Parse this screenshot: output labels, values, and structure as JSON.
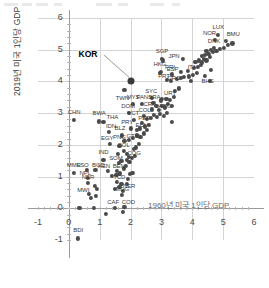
{
  "chart_data": {
    "type": "scatter",
    "title": "",
    "xlabel": "1960년 미국 1인당 GDP",
    "ylabel": "2019년 미국 1인당 GDP",
    "xlim": [
      -1,
      6
    ],
    "ylim": [
      -1,
      6
    ],
    "xticks": [
      "-1",
      "0",
      "1",
      "2",
      "3",
      "4",
      "5",
      "6"
    ],
    "yticks": [
      "-1",
      "0",
      "1",
      "2",
      "3",
      "4",
      "5",
      "6"
    ],
    "grid": true,
    "legend": "none",
    "highlight": {
      "label": "KOR",
      "x": 2.02,
      "y": 4.0,
      "callout_x": 0.62,
      "callout_y": 4.86
    },
    "points": [
      {
        "label": "BDI",
        "x": 0.3,
        "y": -0.95
      },
      {
        "label": "MWI",
        "x": 0.66,
        "y": 0.46
      },
      {
        "label": "NER",
        "x": 0.62,
        "y": 0.8
      },
      {
        "label": "NPL",
        "x": 0.63,
        "y": 0.97
      },
      {
        "label": "LSO",
        "x": 0.58,
        "y": 1.22
      },
      {
        "label": "MMR",
        "x": 0.16,
        "y": 1.12
      },
      {
        "label": "BGD",
        "x": 0.86,
        "y": 1.2
      },
      {
        "label": "IND",
        "x": 1.12,
        "y": 1.52
      },
      {
        "label": "KEN",
        "x": 1.27,
        "y": 1.18
      },
      {
        "label": "BEN",
        "x": 1.55,
        "y": 1.18
      },
      {
        "label": "TCD",
        "x": 1.57,
        "y": 0.84
      },
      {
        "label": "MDG",
        "x": 1.73,
        "y": 0.42
      },
      {
        "label": "NER2",
        "x": 1.76,
        "y": 0.56
      },
      {
        "label": "CAF",
        "x": 1.5,
        "y": 0.02
      },
      {
        "label": "COD",
        "x": 1.8,
        "y": 0.05
      },
      {
        "label": "SOM",
        "x": 1.62,
        "y": 1.42
      },
      {
        "label": "BOL",
        "x": 1.78,
        "y": 1.8
      },
      {
        "label": "COG",
        "x": 1.95,
        "y": 1.62
      },
      {
        "label": "EGY",
        "x": 1.34,
        "y": 2.02
      },
      {
        "label": "IDN",
        "x": 1.3,
        "y": 2.42
      },
      {
        "label": "THA",
        "x": 1.12,
        "y": 2.72
      },
      {
        "label": "BWA",
        "x": 0.98,
        "y": 2.74
      },
      {
        "label": "CHN",
        "x": 0.17,
        "y": 2.78
      },
      {
        "label": "BLZ",
        "x": 1.72,
        "y": 2.3
      },
      {
        "label": "GTM",
        "x": 1.95,
        "y": 2.16
      },
      {
        "label": "PNG",
        "x": 1.8,
        "y": 2.12
      },
      {
        "label": "PRY",
        "x": 2.02,
        "y": 2.52
      },
      {
        "label": "ECU",
        "x": 2.2,
        "y": 2.46
      },
      {
        "label": "VCT",
        "x": 2.12,
        "y": 2.78
      },
      {
        "label": "DOM",
        "x": 1.95,
        "y": 3.02
      },
      {
        "label": "COL",
        "x": 2.42,
        "y": 2.92
      },
      {
        "label": "PER",
        "x": 2.38,
        "y": 2.7
      },
      {
        "label": "MYS",
        "x": 2.08,
        "y": 3.28
      },
      {
        "label": "PAN",
        "x": 2.38,
        "y": 3.3
      },
      {
        "label": "CRI",
        "x": 2.68,
        "y": 3.12
      },
      {
        "label": "ARG",
        "x": 2.92,
        "y": 3.1
      },
      {
        "label": "BRA",
        "x": 2.74,
        "y": 3.32
      },
      {
        "label": "SYC",
        "x": 2.7,
        "y": 3.48
      },
      {
        "label": "URY",
        "x": 3.02,
        "y": 3.46
      },
      {
        "label": "TWN",
        "x": 1.8,
        "y": 3.72
      },
      {
        "label": "SGP",
        "x": 3.02,
        "y": 4.72
      },
      {
        "label": "HKG",
        "x": 2.98,
        "y": 4.3
      },
      {
        "label": "PRI",
        "x": 3.34,
        "y": 4.22
      },
      {
        "label": "PRT",
        "x": 3.18,
        "y": 4.06
      },
      {
        "label": "GRC",
        "x": 3.3,
        "y": 4.02
      },
      {
        "label": "ESP",
        "x": 3.62,
        "y": 4.3
      },
      {
        "label": "ITA",
        "x": 3.86,
        "y": 4.32
      },
      {
        "label": "JPN",
        "x": 3.7,
        "y": 4.72
      },
      {
        "label": "BHS",
        "x": 4.4,
        "y": 4.18
      },
      {
        "label": "DNK",
        "x": 4.7,
        "y": 5.06
      },
      {
        "label": "LUX",
        "x": 4.84,
        "y": 5.46
      },
      {
        "label": "NOR",
        "x": 4.72,
        "y": 5.3
      },
      {
        "label": "BMU",
        "x": 5.1,
        "y": 5.28
      }
    ],
    "extra_points": [
      {
        "x": 0.34,
        "y": 0.02
      },
      {
        "x": 0.8,
        "y": 0.02
      },
      {
        "x": 1.2,
        "y": -0.18
      },
      {
        "x": 1.74,
        "y": -0.12
      },
      {
        "x": 0.72,
        "y": 0.34
      },
      {
        "x": 0.88,
        "y": 0.4
      },
      {
        "x": 0.9,
        "y": 0.62
      },
      {
        "x": 0.84,
        "y": 0.7
      },
      {
        "x": 1.48,
        "y": 0.6
      },
      {
        "x": 1.64,
        "y": 0.68
      },
      {
        "x": 1.7,
        "y": 0.76
      },
      {
        "x": 1.88,
        "y": 0.78
      },
      {
        "x": 1.92,
        "y": 0.92
      },
      {
        "x": 1.98,
        "y": 1.08
      },
      {
        "x": 2.06,
        "y": 1.12
      },
      {
        "x": 1.4,
        "y": 1.02
      },
      {
        "x": 1.54,
        "y": 1.06
      },
      {
        "x": 1.66,
        "y": 1.1
      },
      {
        "x": 1.78,
        "y": 1.26
      },
      {
        "x": 1.86,
        "y": 1.34
      },
      {
        "x": 1.7,
        "y": 1.5
      },
      {
        "x": 1.88,
        "y": 1.52
      },
      {
        "x": 1.96,
        "y": 1.46
      },
      {
        "x": 2.04,
        "y": 1.58
      },
      {
        "x": 2.14,
        "y": 1.66
      },
      {
        "x": 1.6,
        "y": 1.72
      },
      {
        "x": 1.88,
        "y": 1.72
      },
      {
        "x": 2.1,
        "y": 1.86
      },
      {
        "x": 2.18,
        "y": 1.92
      },
      {
        "x": 1.64,
        "y": 1.96
      },
      {
        "x": 2.26,
        "y": 2.02
      },
      {
        "x": 2.08,
        "y": 2.22
      },
      {
        "x": 2.2,
        "y": 2.3
      },
      {
        "x": 2.32,
        "y": 2.26
      },
      {
        "x": 2.44,
        "y": 2.36
      },
      {
        "x": 2.3,
        "y": 2.52
      },
      {
        "x": 2.46,
        "y": 2.58
      },
      {
        "x": 2.54,
        "y": 2.48
      },
      {
        "x": 2.6,
        "y": 2.64
      },
      {
        "x": 2.52,
        "y": 2.82
      },
      {
        "x": 2.66,
        "y": 2.86
      },
      {
        "x": 2.76,
        "y": 2.94
      },
      {
        "x": 2.86,
        "y": 2.88
      },
      {
        "x": 2.96,
        "y": 2.98
      },
      {
        "x": 3.08,
        "y": 2.92
      },
      {
        "x": 3.18,
        "y": 3.02
      },
      {
        "x": 2.84,
        "y": 3.22
      },
      {
        "x": 3.02,
        "y": 3.24
      },
      {
        "x": 3.12,
        "y": 3.18
      },
      {
        "x": 3.22,
        "y": 3.3
      },
      {
        "x": 3.34,
        "y": 3.22
      },
      {
        "x": 2.98,
        "y": 3.4
      },
      {
        "x": 3.16,
        "y": 3.46
      },
      {
        "x": 3.28,
        "y": 3.42
      },
      {
        "x": 3.4,
        "y": 3.52
      },
      {
        "x": 3.44,
        "y": 3.7
      },
      {
        "x": 3.56,
        "y": 3.78
      },
      {
        "x": 3.34,
        "y": 2.72
      },
      {
        "x": 3.5,
        "y": 4.08
      },
      {
        "x": 3.62,
        "y": 4.12
      },
      {
        "x": 3.74,
        "y": 4.14
      },
      {
        "x": 3.9,
        "y": 4.16
      },
      {
        "x": 4.02,
        "y": 4.2
      },
      {
        "x": 4.14,
        "y": 4.26
      },
      {
        "x": 4.06,
        "y": 4.42
      },
      {
        "x": 4.18,
        "y": 4.46
      },
      {
        "x": 4.28,
        "y": 4.52
      },
      {
        "x": 4.1,
        "y": 4.62
      },
      {
        "x": 4.22,
        "y": 4.66
      },
      {
        "x": 4.32,
        "y": 4.6
      },
      {
        "x": 4.38,
        "y": 4.72
      },
      {
        "x": 4.46,
        "y": 4.66
      },
      {
        "x": 4.3,
        "y": 4.8
      },
      {
        "x": 4.42,
        "y": 4.84
      },
      {
        "x": 4.52,
        "y": 4.88
      },
      {
        "x": 4.58,
        "y": 4.78
      },
      {
        "x": 4.46,
        "y": 4.96
      },
      {
        "x": 4.6,
        "y": 5.0
      },
      {
        "x": 4.68,
        "y": 4.92
      },
      {
        "x": 4.78,
        "y": 4.96
      },
      {
        "x": 4.9,
        "y": 5.02
      },
      {
        "x": 5.02,
        "y": 5.06
      },
      {
        "x": 5.16,
        "y": 5.16
      },
      {
        "x": 5.3,
        "y": 5.2
      },
      {
        "x": 4.56,
        "y": 4.02
      },
      {
        "x": 4.6,
        "y": 4.36
      },
      {
        "x": 3.96,
        "y": 4.02
      },
      {
        "x": 2.96,
        "y": 4.28
      },
      {
        "x": 3.06,
        "y": 4.66
      }
    ]
  }
}
